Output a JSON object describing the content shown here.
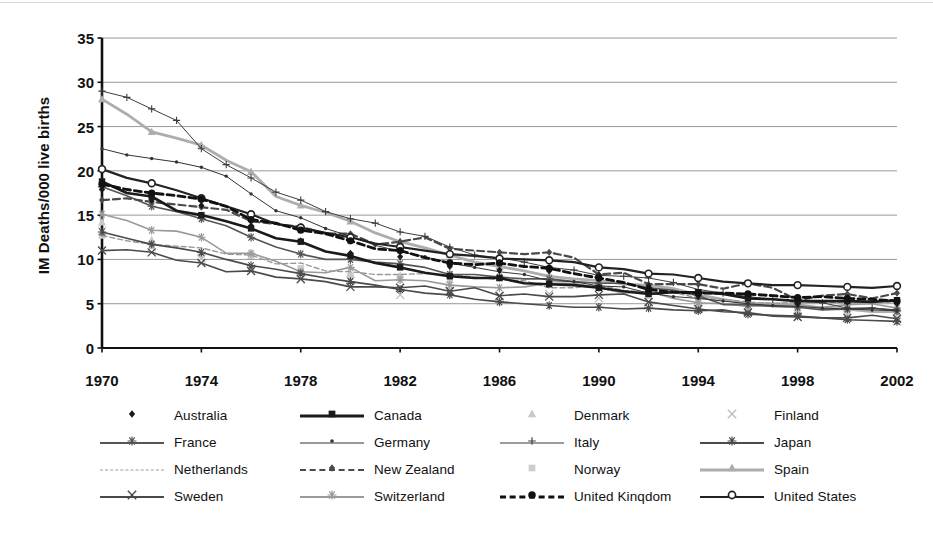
{
  "chart_data": {
    "type": "line",
    "title": "",
    "xlabel": "",
    "ylabel": "IM Deaths/000 live births",
    "xlim": [
      1970,
      2002
    ],
    "ylim": [
      0,
      35
    ],
    "ytick_values": [
      0,
      5,
      10,
      15,
      20,
      25,
      30,
      35
    ],
    "ytick_labels": [
      "0",
      "5",
      "10",
      "15",
      "20",
      "25",
      "30",
      "35"
    ],
    "xtick_values": [
      1970,
      1974,
      1978,
      1982,
      1986,
      1990,
      1994,
      1998,
      2002
    ],
    "xtick_labels": [
      "1970",
      "1974",
      "1978",
      "1982",
      "1986",
      "1990",
      "1994",
      "1998",
      "2002"
    ],
    "grid": "horizontal",
    "legend_position": "bottom",
    "x": [
      1970,
      1971,
      1972,
      1973,
      1974,
      1975,
      1976,
      1977,
      1978,
      1979,
      1980,
      1981,
      1982,
      1983,
      1984,
      1985,
      1986,
      1987,
      1988,
      1989,
      1990,
      1991,
      1992,
      1993,
      1994,
      1995,
      1996,
      1997,
      1998,
      1999,
      2000,
      2001,
      2002
    ],
    "series": [
      {
        "name": "Australia",
        "color": "#1a1a1a",
        "marker": "diamond",
        "line": "none",
        "width": 1.2,
        "values": [
          17.9,
          17.3,
          16.7,
          16.5,
          16.1,
          14.3,
          13.8,
          12.5,
          12.1,
          11.9,
          10.7,
          10.0,
          10.3,
          9.6,
          9.2,
          8.8,
          8.8,
          8.7,
          8.7,
          8.0,
          8.2,
          7.1,
          7.0,
          6.1,
          5.9,
          5.7,
          5.8,
          5.3,
          5.0,
          5.7,
          5.2,
          5.3,
          5.0
        ]
      },
      {
        "name": "Canada",
        "color": "#1a1a1a",
        "marker": "square",
        "line": "solid",
        "width": 2.6,
        "values": [
          18.8,
          17.5,
          17.1,
          15.5,
          15.0,
          14.3,
          13.5,
          12.4,
          12.0,
          10.9,
          10.4,
          9.6,
          9.1,
          8.5,
          8.1,
          7.9,
          7.9,
          7.3,
          7.2,
          7.1,
          6.8,
          6.4,
          6.1,
          6.3,
          6.3,
          6.1,
          5.6,
          5.5,
          5.3,
          5.3,
          5.3,
          5.2,
          5.4
        ]
      },
      {
        "name": "Denmark",
        "color": "#c9c9c9",
        "marker": "triangle",
        "line": "none",
        "width": 1.2,
        "values": [
          14.2,
          13.5,
          12.2,
          11.5,
          10.7,
          10.4,
          10.4,
          8.9,
          8.8,
          8.8,
          8.4,
          7.9,
          8.2,
          7.7,
          7.7,
          7.9,
          8.3,
          8.3,
          7.5,
          8.0,
          7.5,
          7.3,
          6.6,
          5.4,
          5.5,
          5.1,
          5.2,
          5.3,
          4.7,
          4.2,
          5.3,
          4.9,
          4.4
        ]
      },
      {
        "name": "Finland",
        "color": "#bdbdbd",
        "marker": "x",
        "line": "none",
        "width": 1.2,
        "values": [
          13.2,
          12.5,
          11.4,
          10.5,
          10.1,
          9.4,
          9.0,
          9.6,
          7.7,
          7.6,
          7.6,
          6.5,
          6.0,
          6.2,
          6.5,
          6.3,
          5.8,
          6.2,
          6.1,
          6.0,
          5.6,
          5.8,
          5.2,
          4.4,
          4.7,
          3.9,
          4.0,
          3.9,
          4.2,
          3.6,
          3.8,
          3.2,
          3.0
        ]
      },
      {
        "name": "France",
        "color": "#555555",
        "marker": "asterisk",
        "line": "solid",
        "width": 1.6,
        "values": [
          18.2,
          17.2,
          16.0,
          15.4,
          14.6,
          13.8,
          12.5,
          11.4,
          10.6,
          10.0,
          10.0,
          9.7,
          9.5,
          9.1,
          8.3,
          8.3,
          8.0,
          7.8,
          7.8,
          7.5,
          7.3,
          7.3,
          6.8,
          6.5,
          5.9,
          4.9,
          4.9,
          4.7,
          4.6,
          4.3,
          4.4,
          4.5,
          4.2
        ]
      },
      {
        "name": "Germany",
        "color": "#333333",
        "marker": "dot",
        "line": "solid",
        "width": 1.0,
        "values": [
          22.5,
          21.8,
          21.4,
          21.0,
          20.4,
          19.4,
          17.4,
          15.5,
          14.7,
          13.5,
          12.6,
          11.6,
          10.9,
          10.3,
          9.6,
          9.1,
          8.6,
          8.3,
          7.6,
          7.5,
          7.0,
          6.9,
          6.2,
          5.8,
          5.6,
          5.3,
          5.0,
          4.8,
          4.7,
          4.5,
          4.4,
          4.3,
          4.2
        ]
      },
      {
        "name": "Italy",
        "color": "#3d3d3d",
        "marker": "plus",
        "line": "solid",
        "width": 1.0,
        "values": [
          29.0,
          28.3,
          27.0,
          25.7,
          22.5,
          20.7,
          19.2,
          17.6,
          16.7,
          15.4,
          14.6,
          14.1,
          13.1,
          12.6,
          11.4,
          10.5,
          10.2,
          9.7,
          9.1,
          8.8,
          8.2,
          8.1,
          7.9,
          7.4,
          6.6,
          6.2,
          5.8,
          5.5,
          5.3,
          5.1,
          4.5,
          4.5,
          4.3
        ]
      },
      {
        "name": "Japan",
        "color": "#4a4a4a",
        "marker": "asterisk",
        "line": "solid",
        "width": 1.6,
        "values": [
          13.1,
          12.4,
          11.7,
          11.3,
          10.8,
          10.0,
          9.3,
          8.9,
          8.4,
          7.9,
          7.5,
          7.1,
          6.6,
          6.2,
          6.0,
          5.5,
          5.2,
          5.0,
          4.8,
          4.6,
          4.6,
          4.4,
          4.5,
          4.3,
          4.2,
          4.3,
          3.8,
          3.7,
          3.6,
          3.4,
          3.2,
          3.1,
          3.0
        ]
      },
      {
        "name": "Netherlands",
        "color": "#9a9a9a",
        "marker": "none",
        "line": "dashed",
        "width": 1.4,
        "values": [
          12.7,
          12.1,
          11.7,
          11.5,
          11.3,
          10.6,
          10.5,
          9.5,
          9.6,
          8.7,
          8.6,
          8.3,
          8.3,
          8.4,
          8.3,
          8.0,
          7.7,
          7.6,
          6.8,
          6.8,
          7.1,
          6.5,
          6.3,
          6.3,
          5.6,
          5.5,
          5.2,
          5.0,
          5.2,
          5.2,
          5.1,
          5.4,
          5.0
        ]
      },
      {
        "name": "New Zealand",
        "color": "#4a4a4a",
        "marker": "diamond",
        "line": "dashed",
        "width": 2.2,
        "values": [
          16.7,
          16.9,
          16.5,
          16.2,
          15.9,
          15.6,
          14.3,
          14.0,
          13.7,
          12.9,
          12.9,
          11.7,
          12.0,
          12.5,
          11.2,
          11.0,
          10.8,
          10.6,
          10.8,
          10.2,
          8.3,
          8.5,
          7.2,
          7.2,
          7.2,
          6.7,
          7.3,
          6.8,
          5.4,
          5.9,
          6.1,
          5.6,
          6.2
        ]
      },
      {
        "name": "Norway",
        "color": "#cdcdcd",
        "marker": "square",
        "line": "none",
        "width": 1.2,
        "values": [
          12.7,
          12.8,
          11.8,
          11.9,
          10.5,
          11.1,
          10.5,
          9.5,
          9.0,
          8.8,
          8.1,
          8.5,
          8.0,
          7.9,
          8.3,
          8.5,
          7.9,
          8.4,
          8.0,
          7.7,
          6.9,
          6.4,
          5.9,
          5.1,
          5.2,
          4.0,
          4.1,
          4.1,
          4.0,
          3.9,
          3.8,
          3.9,
          3.5
        ]
      },
      {
        "name": "Spain",
        "color": "#adadad",
        "marker": "triangle",
        "line": "solid",
        "width": 2.8,
        "values": [
          28.1,
          26.4,
          24.4,
          23.7,
          22.9,
          21.2,
          19.9,
          17.1,
          16.1,
          15.3,
          14.3,
          13.0,
          12.0,
          11.3,
          10.5,
          9.7,
          9.2,
          8.7,
          8.1,
          7.8,
          7.6,
          7.2,
          7.1,
          6.7,
          6.0,
          5.5,
          5.0,
          5.0,
          4.9,
          4.5,
          4.4,
          4.1,
          4.1
        ]
      },
      {
        "name": "Sweden",
        "color": "#4a4a4a",
        "marker": "x",
        "line": "solid",
        "width": 1.6,
        "values": [
          11.0,
          11.1,
          10.8,
          9.9,
          9.6,
          8.6,
          8.7,
          8.0,
          7.8,
          7.5,
          6.9,
          6.9,
          6.8,
          7.0,
          6.4,
          6.8,
          5.9,
          6.1,
          5.8,
          5.8,
          6.0,
          6.1,
          5.2,
          4.8,
          4.4,
          4.1,
          4.0,
          3.6,
          3.5,
          3.4,
          3.4,
          3.7,
          3.3
        ]
      },
      {
        "name": "Switzerland",
        "color": "#9a9a9a",
        "marker": "asterisk",
        "line": "solid",
        "width": 1.6,
        "values": [
          15.1,
          14.4,
          13.3,
          13.2,
          12.5,
          10.7,
          10.7,
          9.8,
          8.6,
          8.5,
          9.1,
          7.6,
          7.7,
          7.6,
          7.1,
          6.9,
          6.8,
          6.9,
          7.3,
          7.3,
          6.8,
          6.2,
          6.4,
          5.6,
          5.1,
          5.0,
          4.7,
          4.8,
          4.8,
          4.6,
          4.9,
          5.0,
          4.5
        ]
      },
      {
        "name": "United Kinqdom",
        "color": "#111111",
        "marker": "circle-filled",
        "line": "dashed",
        "width": 2.8,
        "values": [
          18.5,
          17.9,
          17.5,
          17.2,
          16.8,
          16.0,
          14.5,
          14.1,
          13.3,
          12.9,
          12.1,
          11.2,
          11.0,
          10.2,
          9.6,
          9.4,
          9.6,
          9.2,
          9.0,
          8.4,
          7.9,
          7.4,
          6.6,
          6.3,
          6.2,
          6.2,
          6.1,
          5.9,
          5.7,
          5.8,
          5.6,
          5.5,
          5.3
        ]
      },
      {
        "name": "United States",
        "color": "#222222",
        "marker": "circle-open",
        "line": "solid",
        "width": 2.2,
        "values": [
          20.2,
          19.2,
          18.6,
          17.8,
          16.9,
          16.0,
          15.1,
          14.0,
          13.6,
          13.0,
          12.5,
          11.8,
          11.4,
          11.0,
          10.6,
          10.4,
          10.1,
          10.0,
          9.9,
          9.7,
          9.1,
          8.9,
          8.4,
          8.3,
          7.9,
          7.5,
          7.3,
          7.1,
          7.1,
          7.0,
          6.9,
          6.8,
          7.0
        ]
      }
    ]
  },
  "legend": {
    "rows": [
      [
        {
          "label": "Australia",
          "series": 0
        },
        {
          "label": "Canada",
          "series": 1
        },
        {
          "label": "Denmark",
          "series": 2
        },
        {
          "label": "Finland",
          "series": 3
        }
      ],
      [
        {
          "label": "France",
          "series": 4
        },
        {
          "label": "Germany",
          "series": 5
        },
        {
          "label": "Italy",
          "series": 6
        },
        {
          "label": "Japan",
          "series": 7
        }
      ],
      [
        {
          "label": "Netherlands",
          "series": 8
        },
        {
          "label": "New Zealand",
          "series": 9
        },
        {
          "label": "Norway",
          "series": 10
        },
        {
          "label": "Spain",
          "series": 11
        }
      ],
      [
        {
          "label": "Sweden",
          "series": 12
        },
        {
          "label": "Switzerland",
          "series": 13
        },
        {
          "label": "United Kinqdom",
          "series": 14
        },
        {
          "label": "United States",
          "series": 15
        }
      ]
    ]
  }
}
